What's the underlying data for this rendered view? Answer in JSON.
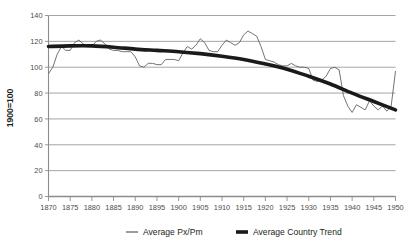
{
  "chart_data": {
    "type": "line",
    "title": "",
    "xlabel": "",
    "ylabel": "1900=100",
    "xlim": [
      1870,
      1950
    ],
    "ylim": [
      0,
      140
    ],
    "ytick_step": 20,
    "xtick_step": 5,
    "grid": "horizontal",
    "legend_position": "bottom",
    "yticks": [
      "0",
      "20",
      "40",
      "60",
      "80",
      "100",
      "120",
      "140"
    ],
    "xticks": [
      "1870",
      "1875",
      "1880",
      "1885",
      "1890",
      "1895",
      "1900",
      "1905",
      "1910",
      "1915",
      "1920",
      "1925",
      "1930",
      "1935",
      "1940",
      "1945",
      "1950"
    ],
    "series": [
      {
        "name": "Average Px/Pm",
        "style": "thin-line",
        "color": "#5a5a5a",
        "x": [
          1870,
          1871,
          1872,
          1873,
          1874,
          1875,
          1876,
          1877,
          1878,
          1879,
          1880,
          1881,
          1882,
          1883,
          1884,
          1885,
          1886,
          1887,
          1888,
          1889,
          1890,
          1891,
          1892,
          1893,
          1894,
          1895,
          1896,
          1897,
          1898,
          1899,
          1900,
          1901,
          1902,
          1903,
          1904,
          1905,
          1906,
          1907,
          1908,
          1909,
          1910,
          1911,
          1912,
          1913,
          1914,
          1915,
          1916,
          1917,
          1918,
          1919,
          1920,
          1921,
          1922,
          1923,
          1924,
          1925,
          1926,
          1927,
          1928,
          1929,
          1930,
          1931,
          1932,
          1933,
          1934,
          1935,
          1936,
          1937,
          1938,
          1939,
          1940,
          1941,
          1942,
          1943,
          1944,
          1945,
          1946,
          1947,
          1948,
          1949,
          1950
        ],
        "values": [
          95,
          100,
          110,
          116,
          113,
          113,
          119,
          121,
          118,
          116,
          116,
          120,
          121,
          118,
          114,
          113,
          113,
          112,
          112,
          112,
          108,
          101,
          100,
          103,
          103,
          102,
          102,
          106,
          106,
          106,
          105,
          111,
          116,
          114,
          117,
          122,
          119,
          113,
          112,
          112,
          117,
          121,
          119,
          117,
          119,
          125,
          128,
          126,
          124,
          116,
          106,
          105,
          104,
          102,
          101,
          101,
          103,
          101,
          100,
          100,
          99,
          90,
          89,
          90,
          93,
          99,
          100,
          98,
          78,
          70,
          65,
          71,
          69,
          67,
          74,
          70,
          67,
          70,
          66,
          70,
          97
        ]
      },
      {
        "name": "Average Country Trend",
        "style": "thick-line",
        "color": "#1a1a1a",
        "x": [
          1870,
          1875,
          1880,
          1885,
          1890,
          1895,
          1900,
          1905,
          1910,
          1915,
          1920,
          1925,
          1930,
          1935,
          1940,
          1945,
          1950
        ],
        "values": [
          116,
          116.5,
          116.5,
          115.5,
          114,
          113,
          112,
          110.5,
          108.5,
          106,
          102.5,
          98.5,
          93,
          87,
          80,
          73.5,
          67
        ]
      }
    ]
  },
  "legend": {
    "items": [
      {
        "label": "Average Px/Pm",
        "marker": "thin-line-marker"
      },
      {
        "label": "Average Country Trend",
        "marker": "thick-line-marker"
      }
    ]
  },
  "axis": {
    "y_axis_title": "1900=100"
  }
}
